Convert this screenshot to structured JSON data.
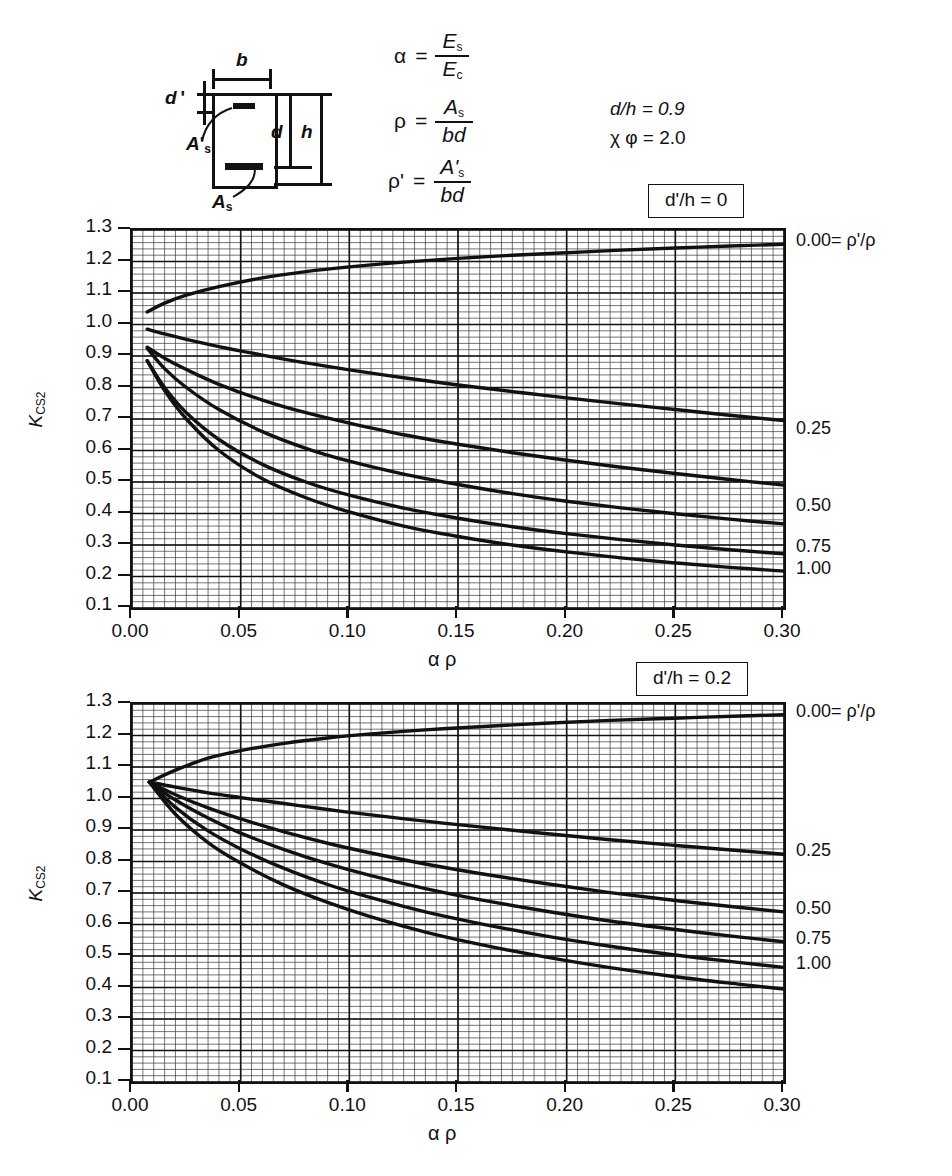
{
  "figure": {
    "diagram": {
      "label_b": "b",
      "label_dprime": "d '",
      "label_As_prime": "A",
      "label_As_prime_sub": "s",
      "label_As": "A",
      "label_As_sub": "s",
      "label_d": "d",
      "label_h": "h"
    },
    "definitions": [
      {
        "name": "alpha-definition",
        "lhs": "α",
        "num": "E",
        "num_sub": "s",
        "den": "E",
        "den_sub": "c"
      },
      {
        "name": "rho-definition",
        "lhs": "ρ",
        "num": "A",
        "num_sub": "s",
        "den": "bd",
        "den_sub": ""
      },
      {
        "name": "rho-prime-definition",
        "lhs": "ρ'",
        "num": "A'",
        "num_sub": "s",
        "den": "bd",
        "den_sub": ""
      }
    ],
    "parameters": [
      "d/h = 0.9",
      "χ φ = 2.0"
    ]
  },
  "chart_data": [
    {
      "name": "chart-top",
      "type": "line",
      "title": "d'/h = 0",
      "xlabel": "α ρ",
      "ylabel": "K",
      "ylabel_sub": "CS2",
      "xlim": [
        0.0,
        0.3
      ],
      "ylim": [
        0.1,
        1.3
      ],
      "xticks": [
        "0.00",
        "0.05",
        "0.10",
        "0.15",
        "0.20",
        "0.25",
        "0.30"
      ],
      "xtick_values": [
        0.0,
        0.05,
        0.1,
        0.15,
        0.2,
        0.25,
        0.3
      ],
      "yticks": [
        "1.3",
        "1.2",
        "1.1",
        "1.0",
        "0.9",
        "0.8",
        "0.7",
        "0.6",
        "0.5",
        "0.4",
        "0.3",
        "0.2",
        "0.1"
      ],
      "ytick_values": [
        1.3,
        1.2,
        1.1,
        1.0,
        0.9,
        0.8,
        0.7,
        0.6,
        0.5,
        0.4,
        0.3,
        0.2,
        0.1
      ],
      "grid": true,
      "grid_minor_x": 0.005,
      "grid_minor_y": 0.02,
      "legend_position": "right",
      "legend_header": "0.00= ρ'/ρ",
      "series": [
        {
          "name": "0.00",
          "label": "0.00= ρ'/ρ",
          "x": [
            0.007,
            0.015,
            0.025,
            0.04,
            0.06,
            0.08,
            0.1,
            0.125,
            0.15,
            0.175,
            0.2,
            0.225,
            0.25,
            0.275,
            0.3
          ],
          "y": [
            1.04,
            1.068,
            1.093,
            1.12,
            1.148,
            1.168,
            1.183,
            1.198,
            1.21,
            1.22,
            1.228,
            1.236,
            1.243,
            1.249,
            1.255
          ]
        },
        {
          "name": "0.25",
          "label": "0.25",
          "x": [
            0.007,
            0.015,
            0.025,
            0.04,
            0.06,
            0.08,
            0.1,
            0.125,
            0.15,
            0.175,
            0.2,
            0.225,
            0.25,
            0.275,
            0.3
          ],
          "y": [
            0.985,
            0.97,
            0.953,
            0.93,
            0.903,
            0.878,
            0.856,
            0.831,
            0.808,
            0.787,
            0.767,
            0.748,
            0.73,
            0.712,
            0.695
          ]
        },
        {
          "name": "0.50",
          "label": "0.50",
          "x": [
            0.007,
            0.015,
            0.025,
            0.04,
            0.06,
            0.08,
            0.1,
            0.125,
            0.15,
            0.175,
            0.2,
            0.225,
            0.25,
            0.275,
            0.3
          ],
          "y": [
            0.928,
            0.893,
            0.857,
            0.81,
            0.76,
            0.72,
            0.687,
            0.65,
            0.62,
            0.593,
            0.569,
            0.547,
            0.527,
            0.508,
            0.49
          ]
        },
        {
          "name": "0.75",
          "label": "0.75",
          "x": [
            0.007,
            0.015,
            0.025,
            0.04,
            0.06,
            0.08,
            0.1,
            0.125,
            0.15,
            0.175,
            0.2,
            0.225,
            0.25,
            0.275,
            0.3
          ],
          "y": [
            0.925,
            0.86,
            0.8,
            0.73,
            0.66,
            0.607,
            0.566,
            0.525,
            0.492,
            0.463,
            0.439,
            0.418,
            0.399,
            0.382,
            0.367
          ]
        },
        {
          "name": "1.00",
          "label": "1.00",
          "x": [
            0.007,
            0.015,
            0.025,
            0.04,
            0.06,
            0.08,
            0.1,
            0.125,
            0.15,
            0.175,
            0.2,
            0.225,
            0.25,
            0.275,
            0.3
          ],
          "y": [
            0.885,
            0.8,
            0.72,
            0.635,
            0.556,
            0.5,
            0.458,
            0.417,
            0.385,
            0.358,
            0.336,
            0.317,
            0.3,
            0.285,
            0.272
          ]
        },
        {
          "name": "1.00b",
          "label": "",
          "x": [
            0.007,
            0.015,
            0.025,
            0.04,
            0.06,
            0.08,
            0.1,
            0.125,
            0.15,
            0.175,
            0.2,
            0.225,
            0.25,
            0.275,
            0.3
          ],
          "y": [
            0.885,
            0.79,
            0.7,
            0.6,
            0.51,
            0.45,
            0.405,
            0.36,
            0.327,
            0.3,
            0.278,
            0.259,
            0.243,
            0.229,
            0.217
          ]
        }
      ],
      "right_labels": [
        {
          "text": "0.00= ρ'/ρ",
          "y": 1.255
        },
        {
          "text": "0.25",
          "y": 0.66
        },
        {
          "text": "0.50",
          "y": 0.415
        },
        {
          "text": "0.75",
          "y": 0.285
        },
        {
          "text": "1.00",
          "y": 0.215
        }
      ]
    },
    {
      "name": "chart-bottom",
      "type": "line",
      "title": "d'/h = 0.2",
      "xlabel": "α ρ",
      "ylabel": "K",
      "ylabel_sub": "CS2",
      "xlim": [
        0.0,
        0.3
      ],
      "ylim": [
        0.1,
        1.3
      ],
      "xticks": [
        "0.00",
        "0.05",
        "0.10",
        "0.15",
        "0.20",
        "0.25",
        "0.30"
      ],
      "xtick_values": [
        0.0,
        0.05,
        0.1,
        0.15,
        0.2,
        0.25,
        0.3
      ],
      "yticks": [
        "1.3",
        "1.2",
        "1.1",
        "1.0",
        "0.9",
        "0.8",
        "0.7",
        "0.6",
        "0.5",
        "0.4",
        "0.3",
        "0.2",
        "0.1"
      ],
      "ytick_values": [
        1.3,
        1.2,
        1.1,
        1.0,
        0.9,
        0.8,
        0.7,
        0.6,
        0.5,
        0.4,
        0.3,
        0.2,
        0.1
      ],
      "grid": true,
      "grid_minor_x": 0.005,
      "grid_minor_y": 0.02,
      "legend_position": "right",
      "legend_header": "0.00= ρ'/ρ",
      "series": [
        {
          "name": "0.00",
          "label": "0.00= ρ'/ρ",
          "x": [
            0.008,
            0.02,
            0.035,
            0.05,
            0.07,
            0.09,
            0.11,
            0.135,
            0.16,
            0.19,
            0.22,
            0.25,
            0.28,
            0.3
          ],
          "y": [
            1.052,
            1.09,
            1.128,
            1.152,
            1.175,
            1.192,
            1.205,
            1.218,
            1.228,
            1.239,
            1.248,
            1.255,
            1.262,
            1.266
          ]
        },
        {
          "name": "0.25",
          "label": "0.25",
          "x": [
            0.008,
            0.02,
            0.035,
            0.05,
            0.07,
            0.09,
            0.11,
            0.135,
            0.16,
            0.19,
            0.22,
            0.25,
            0.28,
            0.3
          ],
          "y": [
            1.052,
            1.036,
            1.018,
            1.003,
            0.984,
            0.965,
            0.948,
            0.928,
            0.91,
            0.889,
            0.869,
            0.851,
            0.834,
            0.823
          ]
        },
        {
          "name": "0.50",
          "label": "0.50",
          "x": [
            0.008,
            0.02,
            0.035,
            0.05,
            0.07,
            0.09,
            0.11,
            0.135,
            0.16,
            0.19,
            0.22,
            0.25,
            0.28,
            0.3
          ],
          "y": [
            1.052,
            1.012,
            0.97,
            0.935,
            0.894,
            0.858,
            0.827,
            0.792,
            0.762,
            0.73,
            0.701,
            0.676,
            0.654,
            0.64
          ]
        },
        {
          "name": "0.75",
          "label": "0.75",
          "x": [
            0.008,
            0.02,
            0.035,
            0.05,
            0.07,
            0.09,
            0.11,
            0.135,
            0.16,
            0.19,
            0.22,
            0.25,
            0.28,
            0.3
          ],
          "y": [
            1.052,
            0.995,
            0.938,
            0.89,
            0.838,
            0.793,
            0.755,
            0.714,
            0.679,
            0.643,
            0.611,
            0.584,
            0.56,
            0.545
          ]
        },
        {
          "name": "1.00",
          "label": "1.00",
          "x": [
            0.008,
            0.02,
            0.035,
            0.05,
            0.07,
            0.09,
            0.11,
            0.135,
            0.16,
            0.19,
            0.22,
            0.25,
            0.28,
            0.3
          ],
          "y": [
            1.052,
            0.972,
            0.897,
            0.84,
            0.778,
            0.727,
            0.685,
            0.64,
            0.603,
            0.564,
            0.531,
            0.503,
            0.479,
            0.464
          ]
        },
        {
          "name": "1.00b",
          "label": "",
          "x": [
            0.008,
            0.02,
            0.035,
            0.05,
            0.07,
            0.09,
            0.11,
            0.135,
            0.16,
            0.19,
            0.22,
            0.25,
            0.28,
            0.3
          ],
          "y": [
            1.052,
            0.95,
            0.86,
            0.795,
            0.725,
            0.67,
            0.624,
            0.576,
            0.537,
            0.497,
            0.463,
            0.434,
            0.41,
            0.395
          ]
        }
      ],
      "right_labels": [
        {
          "text": "0.00= ρ'/ρ",
          "y": 1.266
        },
        {
          "text": "0.25",
          "y": 0.823
        },
        {
          "text": "0.50",
          "y": 0.64
        },
        {
          "text": "0.75",
          "y": 0.545
        },
        {
          "text": "1.00",
          "y": 0.464
        }
      ]
    }
  ],
  "colors": {
    "ink": "#111111",
    "grid": "#3a3a3a",
    "background": "#ffffff"
  }
}
